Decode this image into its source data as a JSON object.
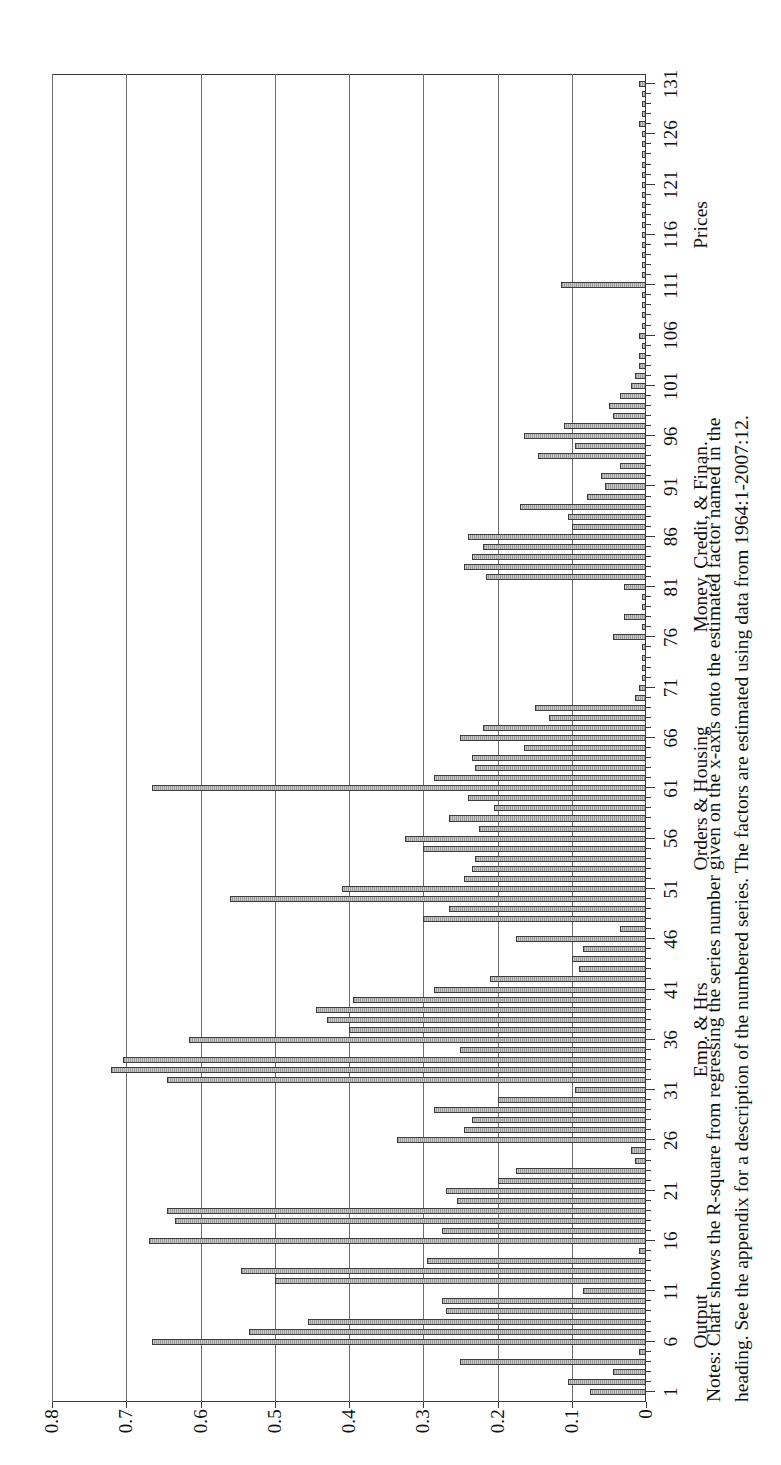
{
  "chart_data": {
    "type": "bar",
    "title": "",
    "xlabel": "",
    "ylabel": "R-square",
    "ylim": [
      0,
      0.8
    ],
    "ytick_labels": [
      "0",
      "0.1",
      "0.2",
      "0.3",
      "0.4",
      "0.5",
      "0.6",
      "0.7",
      "0.8"
    ],
    "ytick_values": [
      0,
      0.1,
      0.2,
      0.3,
      0.4,
      0.5,
      0.6,
      0.7,
      0.8
    ],
    "grid": "horizontal",
    "legend": "none",
    "xtick_labels": [
      "1",
      "6",
      "11",
      "16",
      "21",
      "26",
      "31",
      "36",
      "41",
      "46",
      "51",
      "56",
      "61",
      "66",
      "71",
      "76",
      "81",
      "86",
      "91",
      "96",
      "101",
      "106",
      "111",
      "116",
      "121",
      "126",
      "131"
    ],
    "xtick_values": [
      1,
      6,
      11,
      16,
      21,
      26,
      31,
      36,
      41,
      46,
      51,
      56,
      61,
      66,
      71,
      76,
      81,
      86,
      91,
      96,
      101,
      106,
      111,
      116,
      121,
      126,
      131
    ],
    "group_labels": [
      {
        "label": "Output",
        "center": 8
      },
      {
        "label": "Emp. & Hrs",
        "center": 37
      },
      {
        "label": "Orders & Housing",
        "center": 60
      },
      {
        "label": "Money, Credit, & Finan.",
        "center": 86
      },
      {
        "label": "Prices",
        "center": 117
      }
    ],
    "categories": [
      1,
      2,
      3,
      4,
      5,
      6,
      7,
      8,
      9,
      10,
      11,
      12,
      13,
      14,
      15,
      16,
      17,
      18,
      19,
      20,
      21,
      22,
      23,
      24,
      25,
      26,
      27,
      28,
      29,
      30,
      31,
      32,
      33,
      34,
      35,
      36,
      37,
      38,
      39,
      40,
      41,
      42,
      43,
      44,
      45,
      46,
      47,
      48,
      49,
      50,
      51,
      52,
      53,
      54,
      55,
      56,
      57,
      58,
      59,
      60,
      61,
      62,
      63,
      64,
      65,
      66,
      67,
      68,
      69,
      70,
      71,
      72,
      73,
      74,
      75,
      76,
      77,
      78,
      79,
      80,
      81,
      82,
      83,
      84,
      85,
      86,
      87,
      88,
      89,
      90,
      91,
      92,
      93,
      94,
      95,
      96,
      97,
      98,
      99,
      100,
      101,
      102,
      103,
      104,
      105,
      106,
      107,
      108,
      109,
      110,
      111,
      112,
      113,
      114,
      115,
      116,
      117,
      118,
      119,
      120,
      121,
      122,
      123,
      124,
      125,
      126,
      127,
      128,
      129,
      130,
      131
    ],
    "values": [
      0.075,
      0.105,
      0.045,
      0.25,
      0.01,
      0.665,
      0.535,
      0.455,
      0.27,
      0.275,
      0.085,
      0.5,
      0.545,
      0.295,
      0.01,
      0.67,
      0.275,
      0.635,
      0.645,
      0.255,
      0.27,
      0.2,
      0.175,
      0.015,
      0.02,
      0.335,
      0.245,
      0.235,
      0.285,
      0.2,
      0.095,
      0.645,
      0.72,
      0.705,
      0.25,
      0.615,
      0.4,
      0.43,
      0.445,
      0.395,
      0.285,
      0.21,
      0.09,
      0.1,
      0.085,
      0.175,
      0.035,
      0.3,
      0.265,
      0.56,
      0.41,
      0.245,
      0.235,
      0.23,
      0.3,
      0.325,
      0.225,
      0.265,
      0.205,
      0.24,
      0.665,
      0.285,
      0.23,
      0.235,
      0.165,
      0.25,
      0.22,
      0.13,
      0.15,
      0.015,
      0.01,
      0.005,
      0.005,
      0.005,
      0.005,
      0.045,
      0.005,
      0.03,
      0.005,
      0.005,
      0.03,
      0.215,
      0.245,
      0.235,
      0.22,
      0.24,
      0.1,
      0.105,
      0.17,
      0.08,
      0.055,
      0.06,
      0.035,
      0.145,
      0.095,
      0.165,
      0.11,
      0.045,
      0.05,
      0.035,
      0.02,
      0.015,
      0.01,
      0.01,
      0.005,
      0.01,
      0.005,
      0.005,
      0.005,
      0.005,
      0.115,
      0.005,
      0.005,
      0.005,
      0.005,
      0.005,
      0.005,
      0.005,
      0.005,
      0.005,
      0.005,
      0.005,
      0.005,
      0.005,
      0.005,
      0.005,
      0.01,
      0.005,
      0.005,
      0.005,
      0.01
    ]
  },
  "axis": {
    "y_title": "R-square"
  },
  "notes": {
    "line1": "Notes: Chart shows the R-square from regressing the series number given on the x-axis onto the estimated factor named in the",
    "line2": "heading. See the appendix for a description of the numbered series. The factors are estimated using data from 1964:1-2007:12."
  },
  "style": {
    "bar_fill": "#a8a8a8",
    "bar_edge": "#3c3c3c",
    "axis_color": "#3a3a3a",
    "grid_color": "#6d6d6d"
  }
}
